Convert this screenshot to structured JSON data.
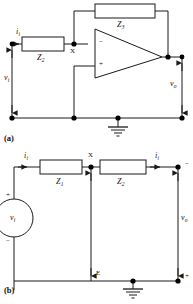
{
  "figure": {
    "panels": [
      {
        "tag": "(a)",
        "name": "op-amp-inverting-amplifier",
        "labels": {
          "feedback_impedance": "Z",
          "feedback_impedance_sub": "3",
          "input_impedance": "Z",
          "input_impedance_sub": "2",
          "node_x": "X",
          "input_current": "i",
          "input_current_sub": "i",
          "input_voltage": "v",
          "input_voltage_sub": "i",
          "output_voltage": "v",
          "output_voltage_sub": "o",
          "opamp_inverting_sign": "−",
          "opamp_noninverting_sign": "+"
        }
      },
      {
        "tag": "(b)",
        "name": "passive-two-impedance-network",
        "labels": {
          "impedance_left": "Z",
          "impedance_left_sub": "1",
          "impedance_right": "Z",
          "impedance_right_sub": "2",
          "node_x": "X",
          "node_e": "E",
          "input_current": "i",
          "input_current_sub": "i",
          "output_current": "i",
          "output_current_sub": "i",
          "source_voltage": "v",
          "source_voltage_sub": "i",
          "output_voltage": "v",
          "output_voltage_sub": "o",
          "source_positive": "+",
          "source_negative": "−",
          "output_positive": "+",
          "output_negative": "−"
        }
      }
    ],
    "colors": {
      "line": "#1a1a1a",
      "background": "#ffffff",
      "node": "#000000"
    }
  }
}
